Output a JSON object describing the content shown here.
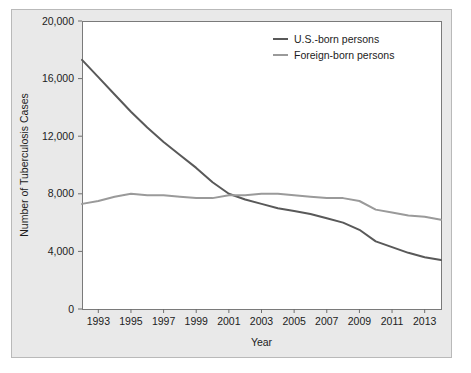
{
  "chart_data": {
    "type": "line",
    "title": "",
    "xlabel": "Year",
    "ylabel": "Number of Tuberculosis Cases",
    "xlim": [
      1992,
      2014
    ],
    "ylim": [
      0,
      20000
    ],
    "grid": false,
    "legend_position": "top-right",
    "x": [
      1992,
      1993,
      1994,
      1995,
      1996,
      1997,
      1998,
      1999,
      2000,
      2001,
      2002,
      2003,
      2004,
      2005,
      2006,
      2007,
      2008,
      2009,
      2010,
      2011,
      2012,
      2013,
      2014
    ],
    "xticks": [
      1993,
      1995,
      1997,
      1999,
      2001,
      2003,
      2005,
      2007,
      2009,
      2011,
      2013
    ],
    "xtick_labels": [
      "1993",
      "1995",
      "1997",
      "1999",
      "2001",
      "2003",
      "2005",
      "2007",
      "2009",
      "2011",
      "2013"
    ],
    "yticks": [
      0,
      4000,
      8000,
      12000,
      16000,
      20000
    ],
    "ytick_labels": [
      "0",
      "4,000",
      "8,000",
      "12,000",
      "16,000",
      "20,000"
    ],
    "series": [
      {
        "name": "U.S.-born persons",
        "color": "#595959",
        "values": [
          17300,
          16100,
          14900,
          13700,
          12600,
          11600,
          10700,
          9800,
          8800,
          8000,
          7600,
          7300,
          7000,
          6800,
          6600,
          6300,
          6000,
          5500,
          4700,
          4300,
          3900,
          3600,
          3400
        ]
      },
      {
        "name": "Foreign-born persons",
        "color": "#9a9a9a",
        "values": [
          7300,
          7500,
          7800,
          8000,
          7900,
          7900,
          7800,
          7700,
          7700,
          7900,
          7900,
          8000,
          8000,
          7900,
          7800,
          7700,
          7700,
          7500,
          6900,
          6700,
          6500,
          6400,
          6200
        ]
      }
    ]
  },
  "legend": {
    "entries": [
      {
        "label": "U.S.-born persons"
      },
      {
        "label": "Foreign-born persons"
      }
    ]
  },
  "colors": {
    "series_us_born": "#595959",
    "series_foreign_born": "#9a9a9a",
    "frame_background": "#e9e9e9",
    "plot_background": "#ffffff",
    "axis": "#6e6e6e"
  }
}
